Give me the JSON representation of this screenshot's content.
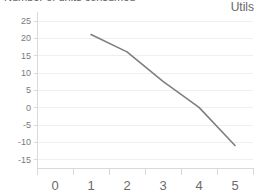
{
  "chart_data": {
    "type": "line",
    "title": "Number of units consumed",
    "subtitle": "",
    "unit_label": "Utils",
    "xlabel": "",
    "ylabel": "",
    "x": [
      1,
      2,
      3,
      4,
      5
    ],
    "series": [
      {
        "name": "Marginal utility",
        "values": [
          21,
          16,
          7.5,
          0,
          -11
        ]
      }
    ],
    "xticks": [
      "0",
      "1",
      "2",
      "3",
      "4",
      "5"
    ],
    "xtick_values": [
      0,
      1,
      2,
      3,
      4,
      5
    ],
    "yticks": [
      "25",
      "20",
      "15",
      "10",
      "5",
      "0",
      "-5",
      "-10",
      "-15"
    ],
    "ytick_values": [
      25,
      20,
      15,
      10,
      5,
      0,
      -5,
      -10,
      -15
    ],
    "xlim": [
      -0.5,
      5.5
    ],
    "ylim": [
      -17.5,
      27.5
    ],
    "grid": true,
    "grid_axis": "y",
    "legend": false,
    "legend_position": "none",
    "line_color": "#7f7f7f",
    "grid_color": "#efefef",
    "axis_color": "#d9d9d9",
    "tick_label_color": "#6b6b6b",
    "background_color": "#ffffff"
  }
}
